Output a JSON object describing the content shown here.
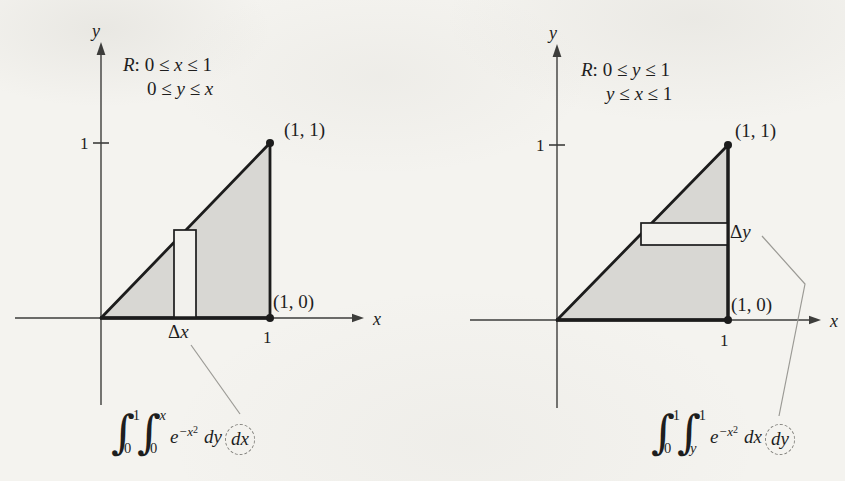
{
  "figure": {
    "bg_color": "#f4f3ef",
    "triangle_fill_color": "#d8d7d3",
    "strip_fill_color": "#f2f1ed",
    "line_color": "#1c1c1c",
    "axis_color": "#3d3d3b",
    "leader_line_color": "#9b9a95",
    "text_color": "#1e1e1e"
  },
  "left": {
    "y_axis_label": "y",
    "x_axis_label": "x",
    "region_line1": [
      {
        "t": "R",
        "i": true
      },
      {
        "t": ": 0 ≤ ",
        "i": false
      },
      {
        "t": "x",
        "i": true
      },
      {
        "t": " ≤ 1",
        "i": false
      }
    ],
    "region_line2": [
      {
        "t": "0 ≤ ",
        "i": false
      },
      {
        "t": "y",
        "i": true
      },
      {
        "t": " ≤ ",
        "i": false
      },
      {
        "t": "x",
        "i": true
      }
    ],
    "y_tick_label": "1",
    "x_tick_label": "1",
    "point_top_label": "(1, 1)",
    "point_bottom_label": "(1, 0)",
    "strip_label": [
      {
        "t": "Δ",
        "i": false
      },
      {
        "t": "x",
        "i": true
      }
    ],
    "integral": {
      "sign": "∫",
      "outer_upper": "1",
      "outer_lower": "0",
      "inner_upper": "x",
      "inner_lower": "0",
      "base": "e",
      "exponent": "−x",
      "exponent_power": "2",
      "inner_diff": "dy",
      "outer_diff": "dx"
    }
  },
  "right": {
    "y_axis_label": "y",
    "x_axis_label": "x",
    "region_line1": [
      {
        "t": "R",
        "i": true
      },
      {
        "t": ": 0 ≤ ",
        "i": false
      },
      {
        "t": "y",
        "i": true
      },
      {
        "t": " ≤ 1",
        "i": false
      }
    ],
    "region_line2": [
      {
        "t": "y",
        "i": true
      },
      {
        "t": " ≤ ",
        "i": false
      },
      {
        "t": "x",
        "i": true
      },
      {
        "t": " ≤ 1",
        "i": false
      }
    ],
    "y_tick_label": "1",
    "x_tick_label": "1",
    "point_top_label": "(1, 1)",
    "point_bottom_label": "(1, 0)",
    "strip_label": [
      {
        "t": "Δ",
        "i": false
      },
      {
        "t": "y",
        "i": true
      }
    ],
    "integral": {
      "sign": "∫",
      "outer_upper": "1",
      "outer_lower": "0",
      "inner_upper": "1",
      "inner_lower": "y",
      "base": "e",
      "exponent": "−x",
      "exponent_power": "2",
      "inner_diff": "dx",
      "outer_diff": "dy"
    }
  }
}
